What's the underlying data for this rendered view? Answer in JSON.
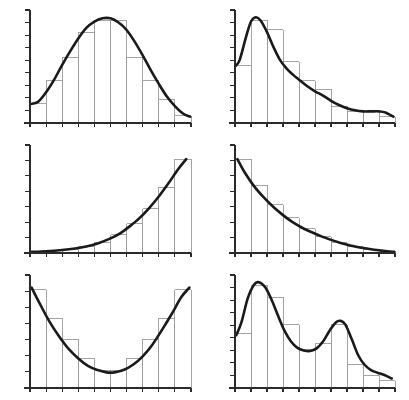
{
  "figure": {
    "type": "multi-panel-histogram-figure",
    "panel_rows": 3,
    "panel_cols": 2,
    "panel_count": 6,
    "background_color": "#ffffff",
    "histogram_color": "#9a9a9a",
    "curve_color": "#1a1a1a",
    "axis_color": "#2b2b2b",
    "curve_width": 2.6,
    "histogram_width": 0.9,
    "axis_width": 1.1,
    "has_titles": false,
    "has_axis_labels": false,
    "has_tick_labels": false,
    "has_legend": false
  },
  "chart_data": [
    {
      "type": "bar",
      "panel_index": 0,
      "panel_position": "top-left",
      "shape_name": "symmetric-bell",
      "title": "",
      "xlabel": "",
      "ylabel": "",
      "grid": false,
      "legend": "none",
      "categories": [
        "1",
        "2",
        "3",
        "4",
        "5",
        "6",
        "7",
        "8",
        "9",
        "10"
      ],
      "x": [
        0.5,
        1.5,
        2.5,
        3.5,
        4.5,
        5.5,
        6.5,
        7.5,
        8.5,
        9.5
      ],
      "values": [
        0.18,
        0.4,
        0.62,
        0.86,
        0.97,
        0.97,
        0.62,
        0.4,
        0.22,
        0.07
      ],
      "bin_edges": [
        0,
        1,
        2,
        3,
        4,
        5,
        6,
        7,
        8,
        9,
        10
      ],
      "xlim": [
        0,
        10
      ],
      "ylim": [
        0,
        1.05
      ],
      "y_tick_count": 9,
      "x_tick_count": 11,
      "series": [
        {
          "name": "density-curve",
          "curve_x": [
            0.05,
            0.5,
            1.0,
            1.5,
            2.0,
            2.5,
            3.0,
            3.5,
            4.0,
            4.5,
            5.0,
            5.5,
            6.0,
            6.5,
            7.0,
            7.5,
            8.0,
            8.5,
            9.0,
            9.5,
            9.95
          ],
          "curve_y": [
            0.18,
            0.2,
            0.29,
            0.41,
            0.55,
            0.68,
            0.8,
            0.9,
            0.96,
            0.99,
            0.99,
            0.95,
            0.88,
            0.77,
            0.64,
            0.5,
            0.37,
            0.25,
            0.16,
            0.09,
            0.06
          ]
        }
      ]
    },
    {
      "type": "bar",
      "panel_index": 1,
      "panel_position": "top-right",
      "shape_name": "right-skewed-long-tail",
      "title": "",
      "xlabel": "",
      "ylabel": "",
      "grid": false,
      "legend": "none",
      "categories": [
        "1",
        "2",
        "3",
        "4",
        "5",
        "6",
        "7",
        "8",
        "9",
        "10"
      ],
      "x": [
        0.5,
        1.5,
        2.5,
        3.5,
        4.5,
        5.5,
        6.5,
        7.5,
        8.5,
        9.5
      ],
      "values": [
        0.54,
        0.97,
        0.88,
        0.58,
        0.4,
        0.32,
        0.16,
        0.11,
        0.11,
        0.06
      ],
      "bin_edges": [
        0,
        1,
        2,
        3,
        4,
        5,
        6,
        7,
        8,
        9,
        10
      ],
      "xlim": [
        0,
        10
      ],
      "ylim": [
        0,
        1.05
      ],
      "y_tick_count": 9,
      "x_tick_count": 11,
      "series": [
        {
          "name": "density-curve",
          "curve_x": [
            0.05,
            0.3,
            0.7,
            1.0,
            1.3,
            1.6,
            2.0,
            2.4,
            2.8,
            3.2,
            3.6,
            4.0,
            4.5,
            5.0,
            5.5,
            6.0,
            6.5,
            7.0,
            7.5,
            8.0,
            8.5,
            9.0,
            9.4,
            9.9
          ],
          "curve_y": [
            0.54,
            0.6,
            0.82,
            0.96,
            1.0,
            0.97,
            0.86,
            0.72,
            0.6,
            0.52,
            0.46,
            0.41,
            0.35,
            0.3,
            0.26,
            0.21,
            0.17,
            0.14,
            0.12,
            0.11,
            0.11,
            0.11,
            0.1,
            0.06
          ]
        }
      ]
    },
    {
      "type": "bar",
      "panel_index": 2,
      "panel_position": "middle-left",
      "shape_name": "exponential-growth-increasing",
      "title": "",
      "xlabel": "",
      "ylabel": "",
      "grid": false,
      "legend": "none",
      "categories": [
        "1",
        "2",
        "3",
        "4",
        "5",
        "6",
        "7",
        "8",
        "9",
        "10"
      ],
      "x": [
        0.5,
        1.5,
        2.5,
        3.5,
        4.5,
        5.5,
        6.5,
        7.5,
        8.5,
        9.5
      ],
      "values": [
        0.01,
        0.02,
        0.03,
        0.06,
        0.1,
        0.18,
        0.29,
        0.44,
        0.65,
        0.93
      ],
      "bin_edges": [
        0,
        1,
        2,
        3,
        4,
        5,
        6,
        7,
        8,
        9,
        10
      ],
      "xlim": [
        0,
        10
      ],
      "ylim": [
        0,
        1.05
      ],
      "y_tick_count": 7,
      "x_tick_count": 11,
      "series": [
        {
          "name": "density-curve",
          "curve_x": [
            0.05,
            1.0,
            2.0,
            2.8,
            3.5,
            4.2,
            5.0,
            5.6,
            6.2,
            6.8,
            7.4,
            8.0,
            8.6,
            9.2,
            9.7
          ],
          "curve_y": [
            0.012,
            0.018,
            0.03,
            0.045,
            0.065,
            0.095,
            0.145,
            0.195,
            0.265,
            0.345,
            0.445,
            0.56,
            0.69,
            0.83,
            0.93
          ]
        }
      ]
    },
    {
      "type": "bar",
      "panel_index": 3,
      "panel_position": "middle-right",
      "shape_name": "exponential-decay-decreasing",
      "title": "",
      "xlabel": "",
      "ylabel": "",
      "grid": false,
      "legend": "none",
      "categories": [
        "1",
        "2",
        "3",
        "4",
        "5",
        "6",
        "7",
        "8",
        "9",
        "10"
      ],
      "x": [
        0.5,
        1.5,
        2.5,
        3.5,
        4.5,
        5.5,
        6.5,
        7.5,
        8.5,
        9.5
      ],
      "values": [
        0.93,
        0.67,
        0.48,
        0.35,
        0.24,
        0.16,
        0.1,
        0.06,
        0.03,
        0.015
      ],
      "bin_edges": [
        0,
        1,
        2,
        3,
        4,
        5,
        6,
        7,
        8,
        9,
        10
      ],
      "xlim": [
        0,
        10
      ],
      "ylim": [
        0,
        1.05
      ],
      "y_tick_count": 7,
      "x_tick_count": 11,
      "series": [
        {
          "name": "density-curve",
          "curve_x": [
            0.15,
            0.6,
            1.2,
            1.8,
            2.4,
            3.0,
            3.6,
            4.2,
            4.8,
            5.4,
            6.0,
            6.6,
            7.2,
            7.8,
            8.4,
            9.0,
            9.5,
            9.95
          ],
          "curve_y": [
            0.93,
            0.8,
            0.66,
            0.55,
            0.455,
            0.375,
            0.305,
            0.25,
            0.205,
            0.165,
            0.13,
            0.1,
            0.075,
            0.055,
            0.04,
            0.027,
            0.018,
            0.012
          ]
        }
      ]
    },
    {
      "type": "bar",
      "panel_index": 4,
      "panel_position": "bottom-left",
      "shape_name": "u-shaped-bimodal-edges",
      "title": "",
      "xlabel": "",
      "ylabel": "",
      "grid": false,
      "legend": "none",
      "categories": [
        "1",
        "2",
        "3",
        "4",
        "5",
        "6",
        "7",
        "8",
        "9",
        "10"
      ],
      "x": [
        0.5,
        1.5,
        2.5,
        3.5,
        4.5,
        5.5,
        6.5,
        7.5,
        8.5,
        9.5
      ],
      "values": [
        0.93,
        0.66,
        0.46,
        0.28,
        0.17,
        0.17,
        0.28,
        0.46,
        0.66,
        0.93
      ],
      "bin_edges": [
        0,
        1,
        2,
        3,
        4,
        5,
        6,
        7,
        8,
        9,
        10
      ],
      "xlim": [
        0,
        10
      ],
      "ylim": [
        0,
        1.05
      ],
      "y_tick_count": 7,
      "x_tick_count": 11,
      "series": [
        {
          "name": "density-curve",
          "curve_x": [
            0.1,
            0.6,
            1.2,
            1.8,
            2.4,
            3.0,
            3.6,
            4.2,
            4.7,
            5.0,
            5.3,
            5.8,
            6.4,
            7.0,
            7.6,
            8.2,
            8.8,
            9.4,
            9.9
          ],
          "curve_y": [
            0.95,
            0.8,
            0.63,
            0.49,
            0.37,
            0.28,
            0.21,
            0.17,
            0.15,
            0.145,
            0.15,
            0.17,
            0.22,
            0.3,
            0.41,
            0.55,
            0.7,
            0.86,
            0.95
          ]
        }
      ]
    },
    {
      "type": "bar",
      "panel_index": 5,
      "panel_position": "bottom-right",
      "shape_name": "bimodal-two-peaks",
      "title": "",
      "xlabel": "",
      "ylabel": "",
      "grid": false,
      "legend": "none",
      "categories": [
        "1",
        "2",
        "3",
        "4",
        "5",
        "6",
        "7",
        "8",
        "9",
        "10"
      ],
      "x": [
        0.5,
        1.5,
        2.5,
        3.5,
        4.5,
        5.5,
        6.5,
        7.5,
        8.5,
        9.5
      ],
      "values": [
        0.52,
        0.97,
        0.86,
        0.6,
        0.36,
        0.42,
        0.6,
        0.22,
        0.12,
        0.07
      ],
      "bin_edges": [
        0,
        1,
        2,
        3,
        4,
        5,
        6,
        7,
        8,
        9,
        10
      ],
      "xlim": [
        0,
        10
      ],
      "ylim": [
        0,
        1.05
      ],
      "y_tick_count": 9,
      "x_tick_count": 11,
      "series": [
        {
          "name": "density-curve",
          "curve_x": [
            0.08,
            0.4,
            0.8,
            1.2,
            1.5,
            1.9,
            2.3,
            2.7,
            3.1,
            3.5,
            3.9,
            4.3,
            4.7,
            5.1,
            5.5,
            5.9,
            6.3,
            6.6,
            6.9,
            7.3,
            7.7,
            8.1,
            8.5,
            8.9,
            9.3,
            9.8
          ],
          "curve_y": [
            0.5,
            0.62,
            0.85,
            0.98,
            1.0,
            0.95,
            0.83,
            0.68,
            0.54,
            0.44,
            0.38,
            0.355,
            0.35,
            0.375,
            0.44,
            0.54,
            0.62,
            0.635,
            0.6,
            0.46,
            0.31,
            0.22,
            0.17,
            0.145,
            0.125,
            0.09
          ]
        }
      ]
    }
  ]
}
